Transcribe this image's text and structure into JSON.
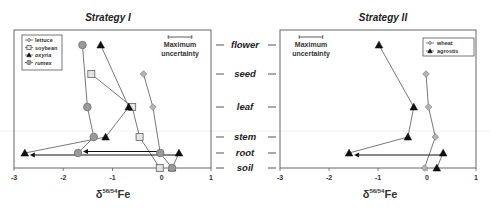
{
  "figure": {
    "category_axis": {
      "labels": [
        "flower",
        "seed",
        "leaf",
        "stem",
        "root",
        "soil"
      ]
    },
    "uncertainty_label": [
      "Maximum",
      "uncertainty"
    ]
  },
  "chart_data": [
    {
      "type": "line",
      "title": "Strategy I",
      "xlabel": {
        "prefix": "δ",
        "sup": "56/54",
        "suffix": "Fe"
      },
      "ylabel": "",
      "xlim": [
        -3,
        1
      ],
      "xticks": [
        -3,
        -2,
        -1,
        0,
        1
      ],
      "categories": [
        "flower",
        "seed",
        "leaf",
        "stem",
        "root",
        "soil"
      ],
      "grid": false,
      "legend_position": "top-left",
      "max_uncertainty": 0.08,
      "series": [
        {
          "name": "lettuce",
          "marker": "diamond",
          "italic": false,
          "points": [
            {
              "cat": "seed",
              "x": -0.37
            },
            {
              "cat": "leaf",
              "x": -0.18
            },
            {
              "cat": "root",
              "x": -0.03
            }
          ]
        },
        {
          "name": "soybean",
          "marker": "square",
          "italic": false,
          "points": [
            {
              "cat": "seed",
              "x": -1.43
            },
            {
              "cat": "leaf",
              "x": -0.6
            },
            {
              "cat": "stem",
              "x": -0.45
            },
            {
              "cat": "soil",
              "x": -0.04
            }
          ]
        },
        {
          "name": "oxyria",
          "marker": "triangle",
          "italic": true,
          "points": [
            {
              "cat": "flower",
              "x": -1.24
            },
            {
              "cat": "leaf",
              "x": -0.67
            },
            {
              "cat": "stem",
              "x": -1.14
            },
            {
              "cat": "root",
              "x": -2.78
            }
          ],
          "extra_points": [
            {
              "cat": "root",
              "x": 0.35
            },
            {
              "cat": "soil",
              "x": 0.21
            }
          ],
          "arrow": {
            "cat": "root",
            "from": 0.35,
            "to": -2.78
          }
        },
        {
          "name": "rumex",
          "marker": "circle",
          "italic": true,
          "points": [
            {
              "cat": "flower",
              "x": -1.61
            },
            {
              "cat": "leaf",
              "x": -1.51
            },
            {
              "cat": "stem",
              "x": -1.38
            },
            {
              "cat": "root",
              "x": -1.7
            }
          ],
          "extra_points": [
            {
              "cat": "root",
              "x": -0.03
            },
            {
              "cat": "soil",
              "x": 0.21
            }
          ],
          "arrow": {
            "cat": "root",
            "from": -0.03,
            "to": -1.7
          }
        }
      ]
    },
    {
      "type": "line",
      "title": "Strategy II",
      "xlabel": {
        "prefix": "δ",
        "sup": "56/54",
        "suffix": "Fe"
      },
      "ylabel": "",
      "xlim": [
        -3,
        1
      ],
      "xticks": [
        -3,
        -2,
        -1,
        0,
        1
      ],
      "categories": [
        "flower",
        "seed",
        "leaf",
        "stem",
        "root",
        "soil"
      ],
      "grid": false,
      "legend_position": "top-right",
      "max_uncertainty": 0.08,
      "series": [
        {
          "name": "wheat",
          "marker": "diamond",
          "italic": false,
          "points": [
            {
              "cat": "seed",
              "x": -0.02
            },
            {
              "cat": "leaf",
              "x": 0.03
            },
            {
              "cat": "stem",
              "x": 0.17
            },
            {
              "cat": "soil",
              "x": -0.05
            }
          ]
        },
        {
          "name": "agrostis",
          "marker": "triangle",
          "italic": false,
          "points": [
            {
              "cat": "flower",
              "x": -0.98
            },
            {
              "cat": "leaf",
              "x": -0.27
            },
            {
              "cat": "stem",
              "x": -0.39
            },
            {
              "cat": "root",
              "x": -1.59
            }
          ],
          "extra_points": [
            {
              "cat": "root",
              "x": 0.33
            },
            {
              "cat": "soil",
              "x": 0.2
            }
          ],
          "arrow": {
            "cat": "root",
            "from": 0.33,
            "to": -1.59
          }
        }
      ]
    }
  ]
}
